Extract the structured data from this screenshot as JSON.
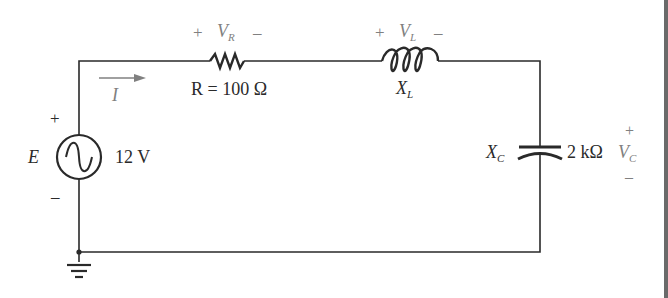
{
  "diagram": {
    "type": "series RLC circuit",
    "colors": {
      "wire": "#2a2a2a",
      "label": "#2a2a2a",
      "polarity": "#808080"
    },
    "source": {
      "symbol": "E",
      "value": "12 V",
      "plus": "+",
      "minus": "–",
      "icon": "ac-sine-icon"
    },
    "current": {
      "symbol": "I",
      "direction": "clockwise"
    },
    "resistor": {
      "label": "R = 100 Ω",
      "voltage": {
        "plus": "+",
        "symbol": "V",
        "sub": "R",
        "minus": "–"
      }
    },
    "inductor": {
      "reactance": {
        "symbol": "X",
        "sub": "L"
      },
      "voltage": {
        "plus": "+",
        "symbol": "V",
        "sub": "L",
        "minus": "–"
      }
    },
    "capacitor": {
      "reactance": {
        "symbol": "X",
        "sub": "C"
      },
      "value": "2 kΩ",
      "voltage": {
        "plus": "+",
        "symbol": "V",
        "sub": "C",
        "minus": "–"
      }
    },
    "ground": {
      "icon": "ground-icon"
    }
  }
}
